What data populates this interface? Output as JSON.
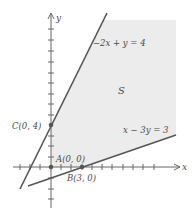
{
  "diagram": {
    "type": "feasible-region",
    "axes": {
      "x_label": "x",
      "y_label": "y"
    },
    "region": {
      "label": "S",
      "fill": "#ececec"
    },
    "lines": [
      {
        "id": "upper",
        "equation": "−2x + y = 4",
        "color": "#555555"
      },
      {
        "id": "lower",
        "equation": "x − 3y = 3",
        "color": "#555555"
      }
    ],
    "points": [
      {
        "id": "A",
        "label": "A(0, 0)",
        "x": 0,
        "y": 0
      },
      {
        "id": "B",
        "label": "B(3, 0)",
        "x": 3,
        "y": 0
      },
      {
        "id": "C",
        "label": "C(0, 4)",
        "x": 0,
        "y": 4
      }
    ]
  }
}
